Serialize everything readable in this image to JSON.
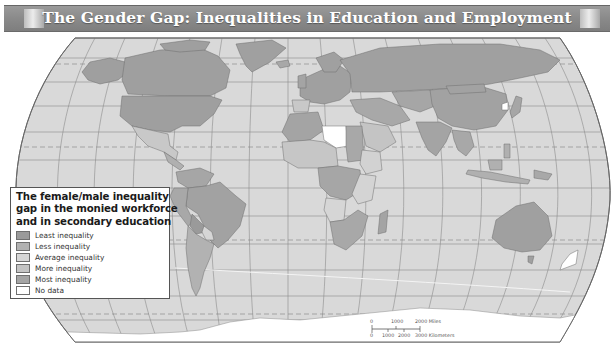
{
  "title": "The Gender Gap: Inequalities in Education and Employment",
  "colors": {
    "title_bar": "#8a8a8a",
    "ocean": "#d9d9d9",
    "graticule": "#8c8c8c",
    "land_border": "#6e6e6e",
    "least": "#9a9a9a",
    "less": "#b2b2b2",
    "average": "#d3d3d3",
    "more": "#c4c4c4",
    "most": "#a4a4a4",
    "no_data": "#ffffff"
  },
  "legend": {
    "title_lines": [
      "The female/male inequality",
      "gap in the monied workforce",
      "and in secondary education"
    ],
    "items": [
      {
        "label": "Least inequality",
        "color": "#9a9a9a"
      },
      {
        "label": "Less inequality",
        "color": "#b2b2b2"
      },
      {
        "label": "Average inequality",
        "color": "#d7d7d7"
      },
      {
        "label": "More inequality",
        "color": "#c4c4c4"
      },
      {
        "label": "Most inequality",
        "color": "#a4a4a4"
      },
      {
        "label": "No data",
        "color": "#ffffff"
      }
    ]
  },
  "scale_bar": {
    "miles_labels": [
      "0",
      "1000",
      "2000 Miles"
    ],
    "km_labels": [
      "0",
      "1000",
      "2000",
      "3000 Kilometers"
    ]
  }
}
